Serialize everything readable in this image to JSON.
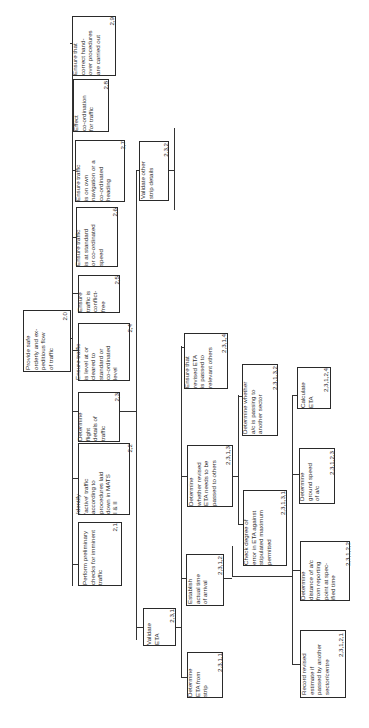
{
  "diagram": {
    "type": "hierarchical-task-analysis",
    "orientation": "rotated-90-ccw",
    "root": {
      "id": "2.0",
      "label": "Provide safe\norderly and ex-\npeditious flow\nof traffic",
      "num": "2.0"
    },
    "level1": [
      {
        "id": "2.1",
        "label": "Perform preliminary\nchecks for imminent\ntraffic",
        "num": "2,1"
      },
      {
        "id": "2.2",
        "label": "Identify\n'active' traffic\naccording to\nprocedures laid\ndown in MATS\nI & II",
        "num": "2,2"
      },
      {
        "id": "2.3",
        "label": "Determine\nflight\ndetails of\ntraffic",
        "num": "2,3"
      },
      {
        "id": "2.4",
        "label": "Ensure traffic\nis level at or\ncleared to\nstandard or\nco-ordinated\nlevel",
        "num": "2,4"
      },
      {
        "id": "2.5",
        "label": "Ensure\ntraffic is\nconflict-\nfree",
        "num": "2,5"
      },
      {
        "id": "2.6",
        "label": "Ensure traffic\nis at standard\nor co-ordinated\nspeed",
        "num": "2,6"
      },
      {
        "id": "2.7",
        "label": "Ensure traffic\nis on own\nnavigation or a\nco-ordinated\nheading",
        "num": "2,7"
      },
      {
        "id": "2.8",
        "label": "Effect\nco-ordination\nfor traffic",
        "num": "2,8"
      },
      {
        "id": "2.9",
        "label": "Ensure that\ncorrect hand-\nover procedures\nare carried out",
        "num": "2,9"
      }
    ],
    "level2": [
      {
        "id": "2.3.1",
        "label": "Validate\nETA",
        "num": "2,3,1"
      },
      {
        "id": "2.3.2",
        "label": "Validate other\nstrip details",
        "num": "2,3,2"
      }
    ],
    "level3": [
      {
        "id": "2.3.1.1",
        "label": "Determine\nETA from\nstrip",
        "num": "2,3,1,1"
      },
      {
        "id": "2.3.1.2",
        "label": "Establish\nactual time\nof arrival",
        "num": "2,3,1,2"
      },
      {
        "id": "2.3.1.3",
        "label": "Determine\nwhether revised\nETA needs to be\npassed to others",
        "num": "2,3,1,3"
      },
      {
        "id": "2.3.1.4",
        "label": "Ensure that\nrevised ETA\nis passed to\nrelevant others",
        "num": "2,3,1,4"
      }
    ],
    "level4": [
      {
        "id": "2.3.1.2.1",
        "label": "Record revised\nestimate if\npassed by another\nsector/centre",
        "num": "2,3,1,2,1"
      },
      {
        "id": "2.3.1.2.2",
        "label": "Determine\ndistance of a/c\nfrom reporting\npoint at spec-\nified time",
        "num": "2,3,1,2,2"
      },
      {
        "id": "2.3.1.2.3",
        "label": "Determine\nground speed\nof a/c",
        "num": "2,3,1,2,3"
      },
      {
        "id": "2.3.1.2.4",
        "label": "Calculate\nETA",
        "num": "2,3,1,2,4"
      },
      {
        "id": "2.3.1.3.1",
        "label": "Check degree of\nerror in ETA against\nstipulated maximum\npermitted",
        "num": "2,3,1,3,1"
      },
      {
        "id": "2.3.1.3.2",
        "label": "Determine whether\na/c is passing to\nanother sector",
        "num": "2,3,1,3,2"
      }
    ]
  },
  "colors": {
    "line": "#333333",
    "box_border": "#2a2a2a",
    "background": "#ffffff",
    "text": "#2b2b2b"
  }
}
